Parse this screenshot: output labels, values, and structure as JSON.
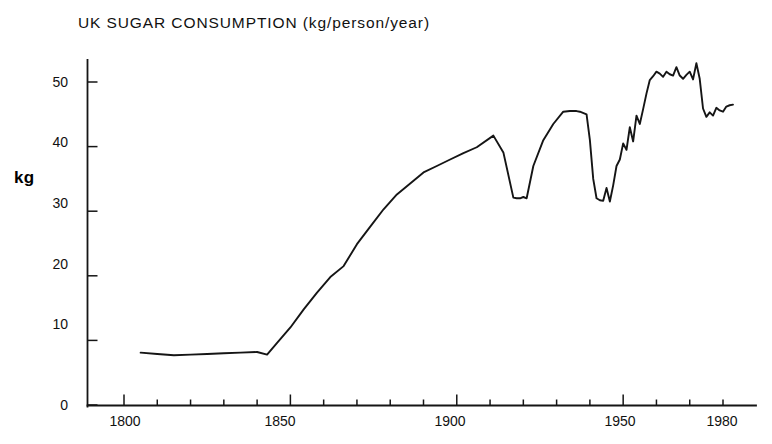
{
  "chart_data": {
    "type": "line",
    "title": "UK SUGAR CONSUMPTION  (kg/person/year)",
    "xlabel": "",
    "ylabel": "kg",
    "xlim": [
      1798,
      1984
    ],
    "ylim": [
      0,
      55
    ],
    "grid": false,
    "legend": null,
    "y_ticks": [
      0,
      10,
      20,
      30,
      40,
      50
    ],
    "y_tick_labels": [
      "0",
      "10",
      "20",
      "30",
      "40",
      "50"
    ],
    "x_ticks": [
      1800,
      1850,
      1900,
      1950,
      1980
    ],
    "x_tick_labels": [
      "1800",
      "1850",
      "1900",
      "1950",
      "1980"
    ],
    "x_minor_tick_interval": 10,
    "series": [
      {
        "name": "UK sugar consumption",
        "color": "#151515",
        "x": [
          1805,
          1810,
          1815,
          1820,
          1825,
          1830,
          1835,
          1840,
          1843,
          1846,
          1850,
          1854,
          1858,
          1862,
          1866,
          1870,
          1874,
          1878,
          1882,
          1886,
          1890,
          1894,
          1898,
          1902,
          1906,
          1911,
          1914,
          1917,
          1918,
          1919,
          1920,
          1921,
          1923,
          1926,
          1929,
          1932,
          1934,
          1936,
          1937,
          1939,
          1940,
          1941,
          1942,
          1943,
          1944,
          1945,
          1946,
          1947,
          1948,
          1949,
          1950,
          1951,
          1952,
          1953,
          1954,
          1955,
          1956,
          1957,
          1958,
          1959,
          1960,
          1961,
          1962,
          1963,
          1964,
          1965,
          1966,
          1967,
          1968,
          1969,
          1970,
          1971,
          1972,
          1973,
          1974,
          1975,
          1976,
          1977,
          1978,
          1979,
          1980,
          1981,
          1982,
          1983
        ],
        "y": [
          8.1,
          7.9,
          7.7,
          7.8,
          7.9,
          8.0,
          8.1,
          8.2,
          7.8,
          9.6,
          12.0,
          14.8,
          17.4,
          19.8,
          21.5,
          24.9,
          27.6,
          30.3,
          32.6,
          34.3,
          36.0,
          37.0,
          38.0,
          39.0,
          39.9,
          41.7,
          39.1,
          32.1,
          32.0,
          32.0,
          32.2,
          32.0,
          37.0,
          41.0,
          43.5,
          45.4,
          45.5,
          45.5,
          45.4,
          45.0,
          41.0,
          35.0,
          32.0,
          31.7,
          31.6,
          33.6,
          31.5,
          34.0,
          37.0,
          38.0,
          40.5,
          39.5,
          43.0,
          40.8,
          44.8,
          43.5,
          45.8,
          48.2,
          50.3,
          50.9,
          51.6,
          51.3,
          50.8,
          51.6,
          51.2,
          51.0,
          52.3,
          51.0,
          50.5,
          51.1,
          51.6,
          50.4,
          52.9,
          50.5,
          45.9,
          44.6,
          45.3,
          44.8,
          46.0,
          45.6,
          45.4,
          46.2,
          46.4,
          46.5
        ]
      }
    ],
    "annotations": [
      {
        "label": "pre-1840 plateau near 8 kg"
      },
      {
        "label": "WWI trough near 32 kg"
      },
      {
        "label": "1930s plateau near 45.5 kg"
      },
      {
        "label": "WWII trough near 31.5 kg"
      },
      {
        "label": "1960s-early 1970s peak above 50 kg"
      }
    ]
  }
}
